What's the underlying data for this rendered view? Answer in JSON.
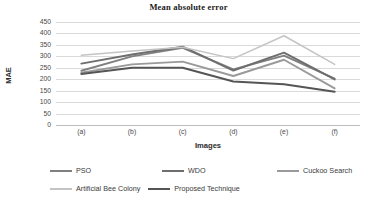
{
  "chart_data": {
    "type": "line",
    "title": "Mean absolute error",
    "xlabel": "Images",
    "ylabel": "MAE",
    "categories": [
      "(a)",
      "(b)",
      "(c)",
      "(d)",
      "(e)",
      "(f)"
    ],
    "ylim": [
      0,
      450
    ],
    "yticks": [
      0,
      50,
      100,
      150,
      200,
      250,
      300,
      350,
      400,
      450
    ],
    "grid": true,
    "legend_position": "bottom",
    "series": [
      {
        "name": "PSO",
        "color": "#808080",
        "values": [
          237,
          300,
          337,
          243,
          303,
          203
        ]
      },
      {
        "name": "WDO",
        "color": "#6e6e6e",
        "values": [
          268,
          308,
          342,
          238,
          316,
          199
        ]
      },
      {
        "name": "Cuckoo Search",
        "color": "#9a9a9a",
        "values": [
          228,
          265,
          277,
          214,
          285,
          160
        ]
      },
      {
        "name": "Artificial Bee Colony",
        "color": "#c4c4c4",
        "values": [
          305,
          323,
          340,
          290,
          390,
          265
        ]
      },
      {
        "name": "Proposed Technique",
        "color": "#555555",
        "values": [
          223,
          250,
          250,
          190,
          178,
          145
        ]
      }
    ]
  },
  "legend": {
    "rows": [
      [
        "PSO",
        "WDO",
        "Cuckoo Search"
      ],
      [
        "Artificial Bee Colony",
        "Proposed Technique"
      ]
    ]
  }
}
